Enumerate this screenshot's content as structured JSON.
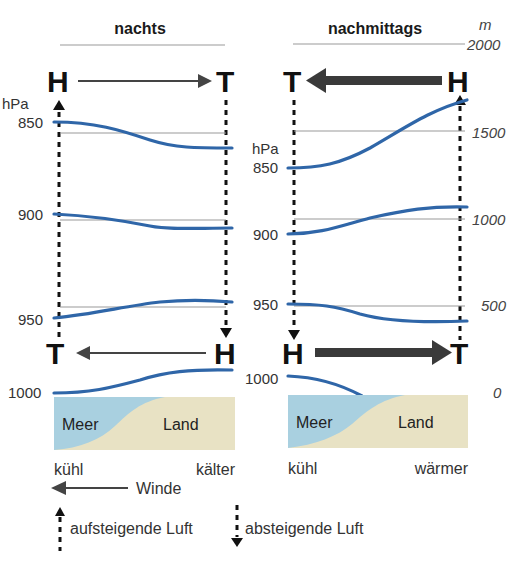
{
  "panels": {
    "night": {
      "title": "nachts",
      "top_left_letter": "H",
      "top_right_letter": "T",
      "bottom_left_letter": "T",
      "bottom_right_letter": "H",
      "pressure_unit": "hPa",
      "isobar_labels": [
        "850",
        "900",
        "950",
        "1000"
      ],
      "sea_label": "Meer",
      "land_label": "Land",
      "sea_temp": "kühl",
      "land_temp": "kälter"
    },
    "afternoon": {
      "title": "nachmittags",
      "top_left_letter": "T",
      "top_right_letter": "H",
      "bottom_left_letter": "H",
      "bottom_right_letter": "T",
      "pressure_unit": "hPa",
      "isobar_labels": [
        "850",
        "900",
        "950",
        "1000"
      ],
      "sea_label": "Meer",
      "land_label": "Land",
      "sea_temp": "kühl",
      "land_temp": "wärmer"
    }
  },
  "altitude_axis": {
    "unit": "m",
    "ticks": [
      "2000",
      "1500",
      "1000",
      "500",
      "0"
    ]
  },
  "legend": {
    "wind": "Winde",
    "rising": "aufsteigende Luft",
    "sinking": "absteigende Luft"
  },
  "colors": {
    "isobar": "#2f66a8",
    "sea": "#a9d0e0",
    "land": "#e8e2c4",
    "arrow": "#3a3a3a"
  }
}
